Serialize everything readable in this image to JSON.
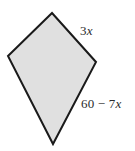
{
  "figure": {
    "name": "kite-quadrilateral",
    "background_color": "#ffffff",
    "shape": {
      "name": "kite-polygon",
      "fill_color": "#e0e0e0",
      "stroke_color": "#1a1a1a",
      "stroke_width": 2,
      "points": "52,13 96,62 53,144 8,56",
      "vertices": [
        {
          "name": "apex-top",
          "x": 52,
          "y": 13
        },
        {
          "name": "vertex-right",
          "x": 96,
          "y": 62
        },
        {
          "name": "apex-bottom",
          "x": 53,
          "y": 144
        },
        {
          "name": "vertex-left",
          "x": 8,
          "y": 56
        }
      ]
    },
    "labels": {
      "top_right_side": {
        "coefficient": "3",
        "variable": "x",
        "full_text": "3x"
      },
      "bottom_right_side": {
        "constant": "60",
        "operator": "−",
        "coefficient": "7",
        "variable": "x",
        "full_text": "60 − 7x"
      }
    }
  }
}
